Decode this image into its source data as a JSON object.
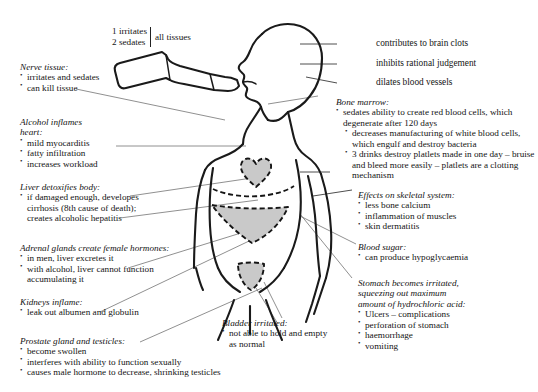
{
  "diagram": {
    "figure_name": "person-drinking-from-bottle",
    "organs_shaded": [
      "heart",
      "liver",
      "bladder"
    ]
  },
  "tissue_label": {
    "line1": "1 irritates",
    "line2": "2 sedates",
    "tail": "all tissues"
  },
  "right_plain_callouts": [
    {
      "text": "contributes to brain clots"
    },
    {
      "text": "inhibits rational judgement"
    },
    {
      "text": "dilates blood vessels"
    }
  ],
  "left_notes": [
    {
      "heading": "Nerve tissue:",
      "items": [
        "irritates and sedates",
        "can kill tissue"
      ]
    },
    {
      "heading_line1": "Alcohol inflames",
      "heading_line2": "heart:",
      "items": [
        "mild myocarditis",
        "fatty infiltration",
        "increases workload"
      ]
    },
    {
      "heading": "Liver detoxifies body:",
      "items": [
        "if damaged enough, developes cirrhosis (8th cause of death); creates alcoholic hepatitis"
      ]
    },
    {
      "heading": "Adrenal glands create female hormones:",
      "items": [
        "in men, liver excretes it",
        "with alcohol, liver cannot function accumulating it"
      ]
    },
    {
      "heading": "Kidneys inflame:",
      "items": [
        "leak out albumen and globulin"
      ]
    },
    {
      "heading": "Prostate gland and testicles:",
      "items": [
        "become swollen",
        "interferes with ability to function sexually",
        "causes male hormone to decrease, shrinking testicles"
      ]
    }
  ],
  "center_notes": [
    {
      "heading": "Bladder irritated:",
      "items": [
        "not able to hold and empty as normal"
      ]
    }
  ],
  "right_notes": [
    {
      "heading": "Bone marrow:",
      "items": [
        "sedates ability to create red blood cells, which degenerate after 120 days",
        "decreases manufacturing of white blood cells, which engulf and destroy bacteria",
        "3 drinks destroy platlets made in one day – bruise and bleed more easily – platlets are a clotting mechanism"
      ]
    },
    {
      "heading": "Effects on skeletal system:",
      "items": [
        "less bone calcium",
        "inflammation of muscles",
        "skin dermatitis"
      ]
    },
    {
      "heading": "Blood sugar:",
      "items": [
        "can produce hypoglycaemia"
      ]
    },
    {
      "heading_line1": "Stomach becomes irritated,",
      "heading_line2": "squeezing out maximum",
      "heading_line3": "amount of hydrochloric acid:",
      "items": [
        "Ulcers – complications",
        "perforation of stomach",
        "haemorrhage",
        "vomiting"
      ]
    }
  ],
  "colors": {
    "organ_fill": "#c9c9c9",
    "outline": "#1a1a1a",
    "leader": "#6b6b6b",
    "text": "#141414",
    "background": "#ffffff"
  }
}
